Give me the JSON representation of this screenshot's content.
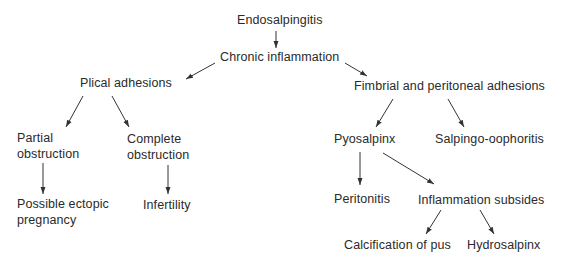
{
  "diagram": {
    "type": "flowchart",
    "nodes": {
      "endosalpingitis": "Endosalpingitis",
      "chronic_inflammation": "Chronic inflammation",
      "plical_adhesions": "Plical adhesions",
      "fimbrial_peritoneal_adhesions": "Fimbrial and peritoneal adhesions",
      "partial_obstruction_1": "Partial",
      "partial_obstruction_2": "obstruction",
      "complete_obstruction_1": "Complete",
      "complete_obstruction_2": "obstruction",
      "possible_ectopic_1": "Possible ectopic",
      "possible_ectopic_2": "pregnancy",
      "infertility": "Infertility",
      "pyosalpinx": "Pyosalpinx",
      "salpingo_oophoritis": "Salpingo-oophoritis",
      "peritonitis": "Peritonitis",
      "inflammation_subsides": "Inflammation subsides",
      "calcification_of_pus": "Calcification of pus",
      "hydrosalpinx": "Hydrosalpinx"
    },
    "edges": [
      [
        "Endosalpingitis",
        "Chronic inflammation"
      ],
      [
        "Chronic inflammation",
        "Plical adhesions"
      ],
      [
        "Chronic inflammation",
        "Fimbrial and peritoneal adhesions"
      ],
      [
        "Plical adhesions",
        "Partial obstruction"
      ],
      [
        "Plical adhesions",
        "Complete obstruction"
      ],
      [
        "Partial obstruction",
        "Possible ectopic pregnancy"
      ],
      [
        "Complete obstruction",
        "Infertility"
      ],
      [
        "Fimbrial and peritoneal adhesions",
        "Pyosalpinx"
      ],
      [
        "Fimbrial and peritoneal adhesions",
        "Salpingo-oophoritis"
      ],
      [
        "Pyosalpinx",
        "Peritonitis"
      ],
      [
        "Pyosalpinx",
        "Inflammation subsides"
      ],
      [
        "Inflammation subsides",
        "Calcification of pus"
      ],
      [
        "Inflammation subsides",
        "Hydrosalpinx"
      ]
    ]
  }
}
